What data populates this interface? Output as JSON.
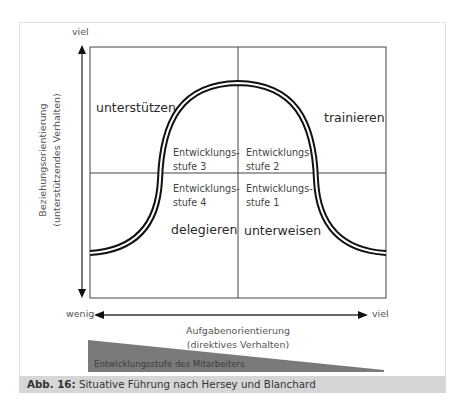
{
  "diagram": {
    "title": "Situative Führung nach Hersey und Blanchard",
    "y_axis": {
      "top_label": "viel",
      "title_line1": "Beziehungsorientierung",
      "title_line2": "(unterstützendes Verhalten)"
    },
    "x_axis": {
      "left_label": "wenig",
      "right_label": "viel",
      "title_line1": "Aufgabenorientierung",
      "title_line2": "(direktives Verhalten)"
    },
    "quadrants": {
      "top_left": {
        "style": "unterstützen",
        "stage_line1": "Entwicklungs-",
        "stage_line2": "stufe 3"
      },
      "top_right": {
        "style": "trainieren",
        "stage_line1": "Entwicklungs-",
        "stage_line2": "stufe 2"
      },
      "bottom_left": {
        "style": "delegieren",
        "stage_line1": "Entwicklungs-",
        "stage_line2": "stufe 4"
      },
      "bottom_right": {
        "style": "unterweisen",
        "stage_line1": "Entwicklungs-",
        "stage_line2": "stufe 1"
      }
    },
    "wedge_label": "Entwicklungsstufe des Mitarbeiters",
    "colors": {
      "wedge": "#7a7a7a",
      "caption_bg": "#d6d6d6",
      "lines": "#333333",
      "curve": "#111111"
    }
  },
  "caption": {
    "prefix": "Abb. 16:",
    "text": "Situative Führung nach Hersey und Blanchard"
  }
}
